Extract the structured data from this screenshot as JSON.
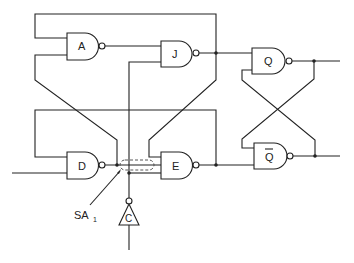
{
  "diagram": {
    "type": "logic-circuit",
    "colors": {
      "line": "#222222",
      "background": "#ffffff"
    },
    "gates": [
      {
        "id": "A",
        "label": "A",
        "kind": "nand"
      },
      {
        "id": "J",
        "label": "J",
        "kind": "nand"
      },
      {
        "id": "Q",
        "label": "Q",
        "kind": "nand"
      },
      {
        "id": "D",
        "label": "D",
        "kind": "nand"
      },
      {
        "id": "E",
        "label": "E",
        "kind": "nand"
      },
      {
        "id": "Qbar",
        "label": "Q",
        "overbar": true,
        "kind": "nand"
      },
      {
        "id": "C",
        "label": "C",
        "kind": "inverter"
      }
    ],
    "fault": {
      "label": "SA",
      "subscript": "1",
      "meaning": "stuck-at-1 fault on D-output / clock crossing"
    }
  }
}
